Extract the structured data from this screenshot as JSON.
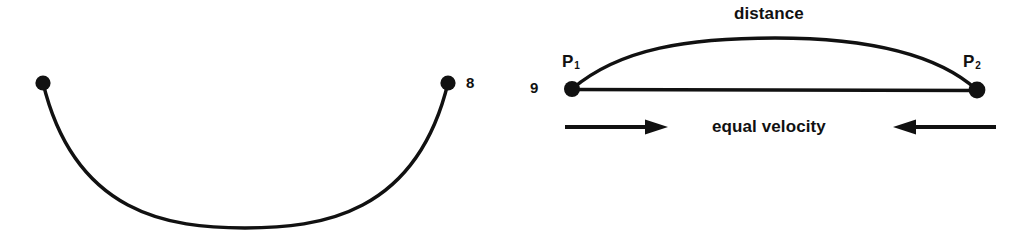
{
  "figures": [
    {
      "id": "figure-8",
      "number": "8",
      "type": "sagging-curve",
      "description": "Downward bowing curve suspended between two endpoint dots",
      "endpoints": [
        {
          "name": "left-endpoint",
          "x": 43,
          "y": 83
        },
        {
          "name": "right-endpoint",
          "x": 448,
          "y": 83
        }
      ],
      "lowest_point": {
        "x": 245,
        "y": 228
      },
      "labels": []
    },
    {
      "id": "figure-9",
      "number": "9",
      "type": "arc-and-chord",
      "description": "Two points joined by a straight chord and an arched path, with inward arrows",
      "points": [
        {
          "name": "p1",
          "label": "P",
          "subscript": "1",
          "x": 572,
          "y": 89
        },
        {
          "name": "p2",
          "label": "P",
          "subscript": "2",
          "x": 977,
          "y": 90
        }
      ],
      "arc": {
        "apex_x": 775,
        "apex_y": 39,
        "label": "distance"
      },
      "chord": {
        "from_x": 572,
        "from_y": 89,
        "to_x": 977,
        "to_y": 90
      },
      "arrows": [
        {
          "name": "left-arrow",
          "direction": "right",
          "from_x": 565,
          "to_x": 660,
          "y": 127
        },
        {
          "name": "right-arrow",
          "direction": "left",
          "from_x": 996,
          "to_x": 901,
          "y": 127
        }
      ],
      "arrow_caption": "equal velocity"
    }
  ],
  "figure8": {
    "number": "8"
  },
  "figure9": {
    "number": "9",
    "p1_label": "P",
    "p1_subscript": "1",
    "p2_label": "P",
    "p2_subscript": "2",
    "distance_label": "distance",
    "velocity_label": "equal velocity"
  },
  "style": {
    "background_color": "#ffffff",
    "ink_color": "#111111",
    "line_width_px": 3
  }
}
